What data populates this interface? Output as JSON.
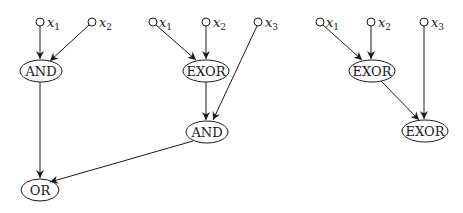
{
  "diagrams": [
    {
      "inputs": [
        {
          "var": "x",
          "sub": "1"
        },
        {
          "var": "x",
          "sub": "2"
        }
      ],
      "gates": [
        {
          "label": "AND"
        },
        {
          "label": "OR"
        }
      ]
    },
    {
      "inputs": [
        {
          "var": "x",
          "sub": "1"
        },
        {
          "var": "x",
          "sub": "2"
        },
        {
          "var": "x",
          "sub": "3"
        }
      ],
      "gates": [
        {
          "label": "EXOR"
        },
        {
          "label": "AND"
        }
      ]
    },
    {
      "inputs": [
        {
          "var": "x",
          "sub": "1"
        },
        {
          "var": "x",
          "sub": "2"
        },
        {
          "var": "x",
          "sub": "3"
        }
      ],
      "gates": [
        {
          "label": "EXOR"
        },
        {
          "label": "EXOR"
        }
      ]
    }
  ]
}
